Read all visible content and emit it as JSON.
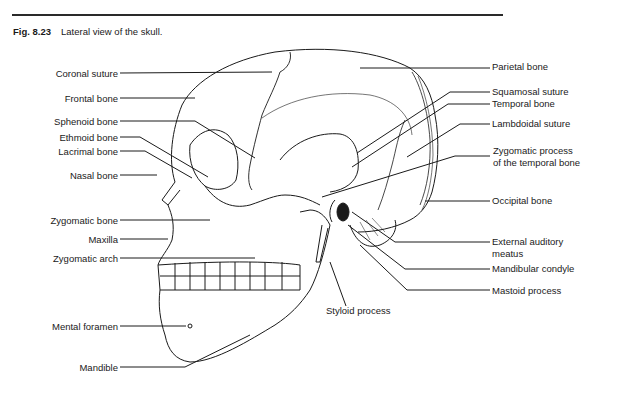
{
  "figure": {
    "number": "Fig. 8.23",
    "caption": "Lateral view of the skull."
  },
  "labels_left": [
    {
      "text": "Coronal suture",
      "x": 118,
      "y": 73
    },
    {
      "text": "Frontal bone",
      "x": 118,
      "y": 98
    },
    {
      "text": "Sphenoid bone",
      "x": 118,
      "y": 121
    },
    {
      "text": "Ethmoid bone",
      "x": 118,
      "y": 137
    },
    {
      "text": "Lacrimal bone",
      "x": 118,
      "y": 151
    },
    {
      "text": "Nasal bone",
      "x": 118,
      "y": 175
    },
    {
      "text": "Zygomatic bone",
      "x": 118,
      "y": 220
    },
    {
      "text": "Maxilla",
      "x": 118,
      "y": 239
    },
    {
      "text": "Zygomatic arch",
      "x": 118,
      "y": 258
    },
    {
      "text": "Mental foramen",
      "x": 118,
      "y": 326
    },
    {
      "text": "Mandible",
      "x": 118,
      "y": 367
    }
  ],
  "labels_right": [
    {
      "text": "Parietal bone",
      "x": 492,
      "y": 66
    },
    {
      "text": "Squamosal suture",
      "x": 492,
      "y": 91
    },
    {
      "text": "Temporal bone",
      "x": 492,
      "y": 103
    },
    {
      "text": "Lambdoidal suture",
      "x": 492,
      "y": 123
    },
    {
      "text": "Zygomatic process",
      "x": 493,
      "y": 150
    },
    {
      "text": "of the temporal bone",
      "x": 493,
      "y": 162
    },
    {
      "text": "Occipital bone",
      "x": 492,
      "y": 200
    },
    {
      "text": "External auditory",
      "x": 492,
      "y": 240
    },
    {
      "text": "meatus",
      "x": 492,
      "y": 252
    },
    {
      "text": "Mandibular condyle",
      "x": 492,
      "y": 267
    },
    {
      "text": "Mastoid process",
      "x": 492,
      "y": 289
    }
  ],
  "labels_bottom": [
    {
      "text": "Styloid process",
      "x": 326,
      "y": 310
    }
  ]
}
